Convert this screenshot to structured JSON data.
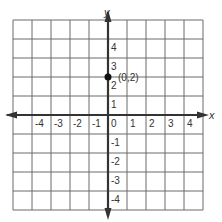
{
  "chart_data": {
    "type": "scatter",
    "title": "",
    "xlabel": "x",
    "ylabel": "y",
    "xlim": [
      -5,
      5
    ],
    "ylim": [
      -5,
      5
    ],
    "grid": true,
    "x_ticks": [
      "-4",
      "-3",
      "-2",
      "-1",
      "0",
      "1",
      "2",
      "3",
      "4"
    ],
    "y_ticks": [
      "4",
      "3",
      "2",
      "1",
      "-1",
      "-2",
      "-3",
      "-4"
    ],
    "points": [
      {
        "x": 0,
        "y": 2,
        "label": "(0,2)"
      }
    ]
  },
  "colors": {
    "grid": "#6b6b6b",
    "axis": "#333333",
    "point": "#111111"
  }
}
